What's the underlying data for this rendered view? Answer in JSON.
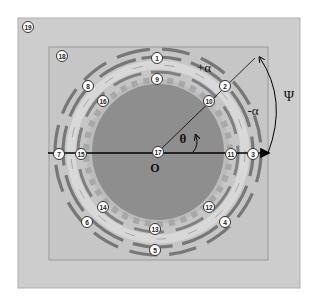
{
  "diagram": {
    "center_label": "O",
    "angle_labels": {
      "plus_alpha": "+α",
      "minus_alpha": "-α",
      "theta": "θ",
      "psi": "Ψ"
    },
    "markers": [
      {
        "id": "1",
        "text": "1"
      },
      {
        "id": "2",
        "text": "2"
      },
      {
        "id": "3",
        "text": "3"
      },
      {
        "id": "4",
        "text": "4"
      },
      {
        "id": "5",
        "text": "5"
      },
      {
        "id": "6",
        "text": "6"
      },
      {
        "id": "7",
        "text": "7"
      },
      {
        "id": "8",
        "text": "8"
      },
      {
        "id": "9",
        "text": "9"
      },
      {
        "id": "10",
        "text": "10"
      },
      {
        "id": "11",
        "text": "11"
      },
      {
        "id": "12",
        "text": "12"
      },
      {
        "id": "13",
        "text": "13"
      },
      {
        "id": "14",
        "text": "14"
      },
      {
        "id": "15",
        "text": "15"
      },
      {
        "id": "16",
        "text": "16"
      },
      {
        "id": "17",
        "text": "17"
      },
      {
        "id": "18",
        "text": "18"
      },
      {
        "id": "19",
        "text": "19"
      }
    ],
    "colors": {
      "outer_box": "#cfcfcf",
      "inner_box": "#c4c4c4",
      "ring": "#b8b8b8",
      "core": "#8f8f8f",
      "arc": "#7a7a7a",
      "axis": "#000000"
    }
  }
}
